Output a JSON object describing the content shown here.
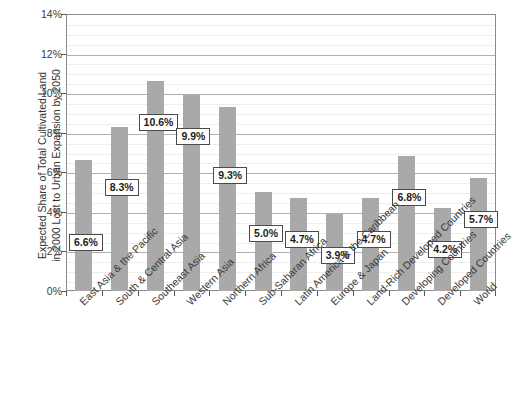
{
  "chart_data": {
    "type": "bar",
    "title": "",
    "subtitle": "",
    "xlabel": "",
    "ylabel": "Expected Share of Total Cultivated Land\nin 2000 Lost to Urban Expansion by 2050",
    "ylabel_line1": "Expected Share of Total Cultivated Land",
    "ylabel_line2": "in 2000 Lost to Urban Expansion by 2050",
    "categories": [
      "East Asia & the Pacific",
      "South & Central Asia",
      "Southeast Asia",
      "Western Asia",
      "Northern Africa",
      "Sub-Saharan Africa",
      "Latin America & the Caribbean",
      "Europe & Japan",
      "Land-Rich Developed Countries",
      "Developing Countries",
      "Developed Countries",
      "World"
    ],
    "values": [
      6.6,
      8.3,
      10.6,
      9.9,
      9.3,
      5.0,
      4.7,
      3.9,
      4.7,
      6.8,
      4.2,
      5.7
    ],
    "data_labels": [
      "6.6%",
      "8.3%",
      "10.6%",
      "9.9%",
      "9.3%",
      "5.0%",
      "4.7%",
      "3.9%",
      "4.7%",
      "6.8%",
      "4.2%",
      "5.7%"
    ],
    "ylim": [
      0,
      14
    ],
    "ytick_values": [
      0,
      2,
      4,
      6,
      8,
      10,
      12,
      14
    ],
    "ytick_labels": [
      "0%",
      "2%",
      "4%",
      "6%",
      "8%",
      "10%",
      "12%",
      "14%"
    ],
    "y_minor_step": 0.5,
    "grid": true,
    "grid_axis": "y",
    "legend": "none",
    "bar_color": "#a9a9a9",
    "label_box_border_color": "#4a4a4a",
    "axis_color": "#8a8a8a",
    "gridline_color": "#b0b0b0",
    "minor_gridline_color": "#eeeeee",
    "background": "#ffffff"
  }
}
